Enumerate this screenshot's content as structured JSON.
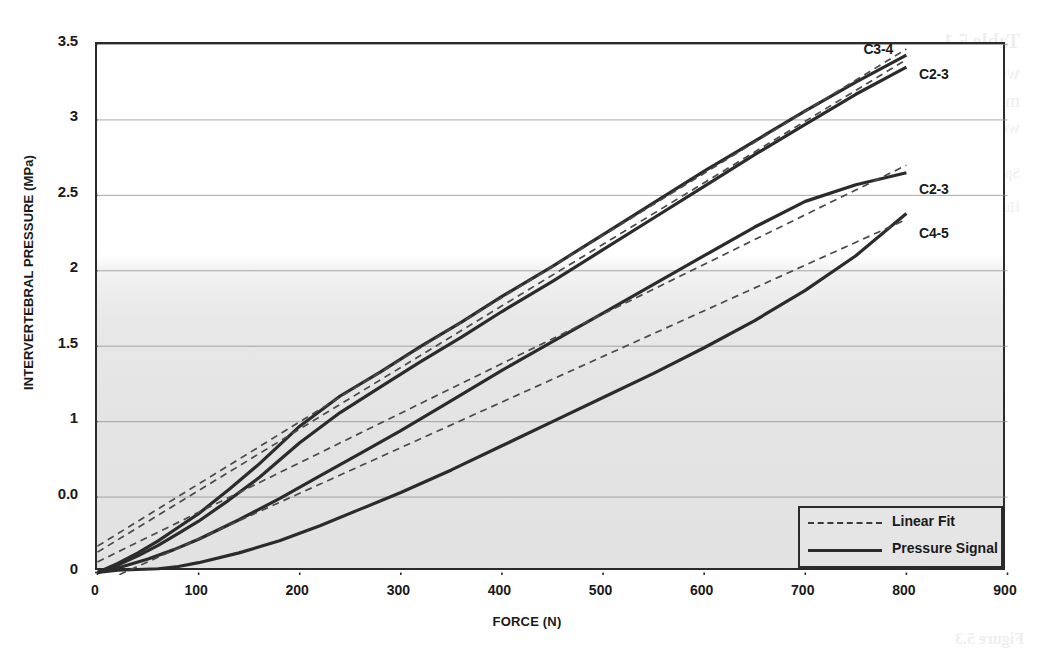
{
  "figure": {
    "kind": "scientific-line-chart",
    "background_note": "scanned book page with faint mirrored bleed-through text"
  },
  "bleed_text": [
    {
      "t": "Table 5.1",
      "x": 34,
      "y": 30,
      "size": 20,
      "weight": "bold"
    },
    {
      "t": "wedge forces and intervertebral forces for",
      "x": 34,
      "y": 62,
      "size": 19
    },
    {
      "t": "median plane compressed loads and",
      "x": 34,
      "y": 90,
      "size": 19
    },
    {
      "t": "wedge values in constant increments",
      "x": 34,
      "y": 118,
      "size": 17
    },
    {
      "t": "Specimen        Level        Compression        Wedge        Force",
      "x": 34,
      "y": 166,
      "size": 14
    },
    {
      "t": "Human cadaveric     segment    C2-3 / C3-4 / C4-5    pressure    signal",
      "x": 34,
      "y": 200,
      "size": 14
    },
    {
      "t": "Figure 5.3",
      "x": 30,
      "y": 630,
      "size": 16,
      "weight": "bold"
    }
  ],
  "chart_data": {
    "type": "line",
    "title": "",
    "xlabel": "FORCE (N)",
    "ylabel": "INTERVERTEBRAL PRESSURE (MPa)",
    "xlim": [
      0,
      900
    ],
    "ylim": [
      0,
      3.5
    ],
    "xticks": [
      0,
      100,
      200,
      300,
      400,
      500,
      600,
      700,
      800,
      900
    ],
    "xtick_labels": [
      "0",
      "100",
      "200",
      "300",
      "400",
      "500",
      "600",
      "700",
      "800",
      "900"
    ],
    "yticks": [
      0,
      0.5,
      1,
      1.5,
      2,
      2.5,
      3,
      3.5
    ],
    "ytick_labels": [
      "0",
      "0.0",
      "1",
      "1.5",
      "2",
      "2.5",
      "3",
      "3.5"
    ],
    "grid": "horizontal",
    "grid_color": "#8d8d8d",
    "axis_color": "#2b2b2b",
    "legend": {
      "position": "bottom-right",
      "entries": [
        {
          "label": "Linear Fit",
          "style": "dashed"
        },
        {
          "label": "Pressure Signal",
          "style": "solid"
        }
      ]
    },
    "annotations": [
      {
        "label": "C3-4",
        "x": 760,
        "y": 3.45
      },
      {
        "label": "C2-3",
        "x": 815,
        "y": 3.28
      },
      {
        "label": "C2-3",
        "x": 815,
        "y": 2.52
      },
      {
        "label": "C4-5",
        "x": 815,
        "y": 2.23
      }
    ],
    "series": [
      {
        "name": "C3-4 Pressure Signal",
        "style": "solid",
        "x": [
          0,
          20,
          40,
          60,
          80,
          100,
          130,
          160,
          200,
          240,
          280,
          320,
          360,
          400,
          450,
          500,
          550,
          600,
          650,
          700,
          750,
          800
        ],
        "y": [
          0.0,
          0.06,
          0.13,
          0.21,
          0.3,
          0.39,
          0.55,
          0.72,
          0.97,
          1.17,
          1.33,
          1.5,
          1.66,
          1.83,
          2.03,
          2.24,
          2.45,
          2.66,
          2.86,
          3.06,
          3.25,
          3.43
        ]
      },
      {
        "name": "C3-4 Linear Fit",
        "style": "dashed",
        "x": [
          0,
          800
        ],
        "y": [
          0.175,
          3.47
        ]
      },
      {
        "name": "C2-3 upper Pressure Signal",
        "style": "solid",
        "x": [
          0,
          20,
          40,
          60,
          80,
          100,
          130,
          160,
          200,
          240,
          280,
          320,
          360,
          400,
          450,
          500,
          550,
          600,
          650,
          700,
          750,
          800
        ],
        "y": [
          0.0,
          0.05,
          0.11,
          0.18,
          0.26,
          0.34,
          0.48,
          0.63,
          0.86,
          1.06,
          1.23,
          1.4,
          1.56,
          1.73,
          1.93,
          2.14,
          2.35,
          2.56,
          2.77,
          2.97,
          3.17,
          3.35
        ]
      },
      {
        "name": "C2-3 upper Linear Fit",
        "style": "dashed",
        "x": [
          0,
          800
        ],
        "y": [
          0.135,
          3.4
        ]
      },
      {
        "name": "C2-3 lower Pressure Signal",
        "style": "solid",
        "x": [
          0,
          25,
          50,
          75,
          100,
          140,
          180,
          220,
          260,
          300,
          350,
          400,
          450,
          500,
          550,
          600,
          650,
          700,
          750,
          800
        ],
        "y": [
          0.0,
          0.04,
          0.09,
          0.15,
          0.22,
          0.35,
          0.49,
          0.64,
          0.79,
          0.94,
          1.14,
          1.34,
          1.53,
          1.72,
          1.91,
          2.1,
          2.29,
          2.46,
          2.57,
          2.65
        ]
      },
      {
        "name": "C2-3 lower Linear Fit",
        "style": "dashed",
        "x": [
          0,
          800
        ],
        "y": [
          0.07,
          2.7
        ]
      },
      {
        "name": "C4-5 Pressure Signal",
        "style": "solid",
        "x": [
          0,
          20,
          40,
          60,
          80,
          100,
          140,
          180,
          220,
          260,
          300,
          350,
          400,
          450,
          500,
          550,
          600,
          650,
          700,
          750,
          800
        ],
        "y": [
          0.0,
          0.015,
          0.02,
          0.025,
          0.04,
          0.065,
          0.13,
          0.21,
          0.31,
          0.42,
          0.53,
          0.68,
          0.84,
          1.0,
          1.16,
          1.32,
          1.49,
          1.67,
          1.87,
          2.1,
          2.38
        ]
      },
      {
        "name": "C4-5 Linear Fit",
        "style": "dashed",
        "x": [
          0,
          800
        ],
        "y": [
          -0.08,
          2.34
        ]
      }
    ]
  }
}
